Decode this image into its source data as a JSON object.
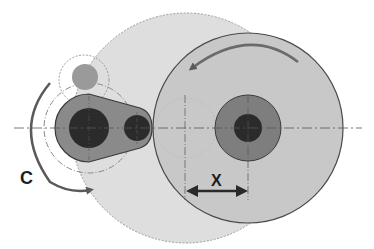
{
  "diagram": {
    "labels": {
      "rotation": "C",
      "offset": "X"
    },
    "colors": {
      "background": "#ffffff",
      "large_disc": "#c8c8c8",
      "swept_area": "#dedede",
      "hub": "#7e7e7e",
      "bore": "#2b2b2b",
      "link_arm": "#8a8a8a",
      "pin": "#9a9a9a",
      "outline": "#4a4a4a",
      "arrow": "#5a5a5a",
      "dimension_arrow": "#2a2a2a",
      "center_line": "#555555"
    }
  }
}
